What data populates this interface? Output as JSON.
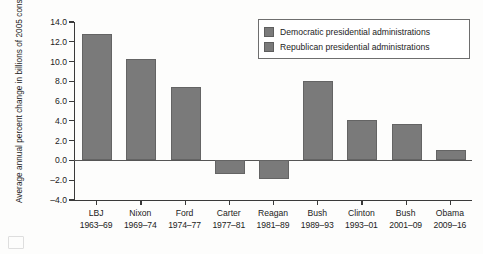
{
  "chart_data": {
    "type": "bar",
    "title": "",
    "xlabel": "",
    "ylabel": "Average annual percent change in billions of 2005 constant dollars",
    "ylim": [
      -4.0,
      14.0
    ],
    "ytick_step": 2.0,
    "grid": false,
    "legend_position": "top-right",
    "categories": [
      "LBJ 1963–69",
      "Nixon 1969–74",
      "Ford 1974–77",
      "Carter 1977–81",
      "Reagan 1981–89",
      "Bush 1989–93",
      "Clinton 1993–01",
      "Bush 2001–09",
      "Obama 2009–16"
    ],
    "values": [
      12.8,
      10.3,
      7.4,
      -1.4,
      -1.9,
      8.0,
      4.1,
      3.7,
      1.1
    ],
    "bars": [
      {
        "name": "LBJ",
        "years": "1963–69",
        "value": 12.8,
        "party": "Democratic"
      },
      {
        "name": "Nixon",
        "years": "1969–74",
        "value": 10.3,
        "party": "Republican"
      },
      {
        "name": "Ford",
        "years": "1974–77",
        "value": 7.4,
        "party": "Republican"
      },
      {
        "name": "Carter",
        "years": "1977–81",
        "value": -1.4,
        "party": "Democratic"
      },
      {
        "name": "Reagan",
        "years": "1981–89",
        "value": -1.9,
        "party": "Republican"
      },
      {
        "name": "Bush",
        "years": "1989–93",
        "value": 8.0,
        "party": "Republican"
      },
      {
        "name": "Clinton",
        "years": "1993–01",
        "value": 4.1,
        "party": "Democratic"
      },
      {
        "name": "Bush",
        "years": "2001–09",
        "value": 3.7,
        "party": "Republican"
      },
      {
        "name": "Obama",
        "years": "2009–16",
        "value": 1.1,
        "party": "Democratic"
      }
    ],
    "ytick_labels": [
      "14.0",
      "12.0",
      "10.0",
      "8.0",
      "6.0",
      "4.0",
      "2.0",
      "0.0",
      "–2.0",
      "–4.0"
    ],
    "ytick_values": [
      14.0,
      12.0,
      10.0,
      8.0,
      6.0,
      4.0,
      2.0,
      0.0,
      -2.0,
      -4.0
    ],
    "legend": [
      {
        "label": "Democratic presidential administrations",
        "color": "#7a7a7a"
      },
      {
        "label": "Republican presidential administrations",
        "color": "#7a7a7a"
      }
    ],
    "colors": {
      "bar_fill": "#7a7a7a",
      "bar_stroke": "#646464",
      "axis": "#3a3a3a",
      "text": "#222222",
      "background": "#fdfdfc"
    }
  }
}
